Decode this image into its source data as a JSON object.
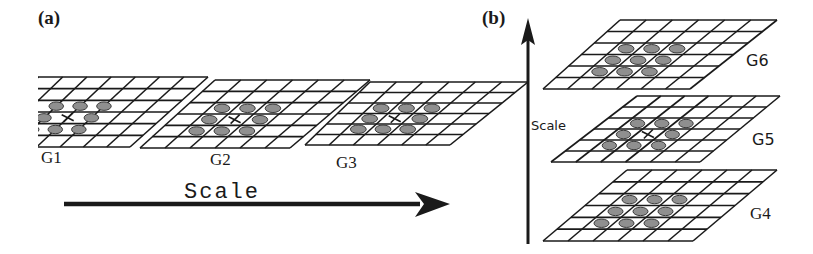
{
  "panels": {
    "a": {
      "label": "(a)",
      "axis_label": "Scale",
      "axis_direction": "horizontal-right",
      "grids": [
        {
          "id": "G1",
          "label": "G1",
          "has_center_cross": true
        },
        {
          "id": "G2",
          "label": "G2",
          "has_center_cross": true
        },
        {
          "id": "G3",
          "label": "G3",
          "has_center_cross": true
        }
      ]
    },
    "b": {
      "label": "(b)",
      "axis_label": "Scale",
      "axis_direction": "vertical-up",
      "grids": [
        {
          "id": "G6",
          "label": "G6",
          "has_center_cross": false
        },
        {
          "id": "G5",
          "label": "G5",
          "has_center_cross": true
        },
        {
          "id": "G4",
          "label": "G4",
          "has_center_cross": false
        }
      ]
    }
  },
  "grid_spec": {
    "columns": 6,
    "rows": 6,
    "neighbor_blobs": 8,
    "neighborhood": "3x3",
    "blob_color": "#8f8f8f",
    "line_color": "#1a1a1a"
  }
}
